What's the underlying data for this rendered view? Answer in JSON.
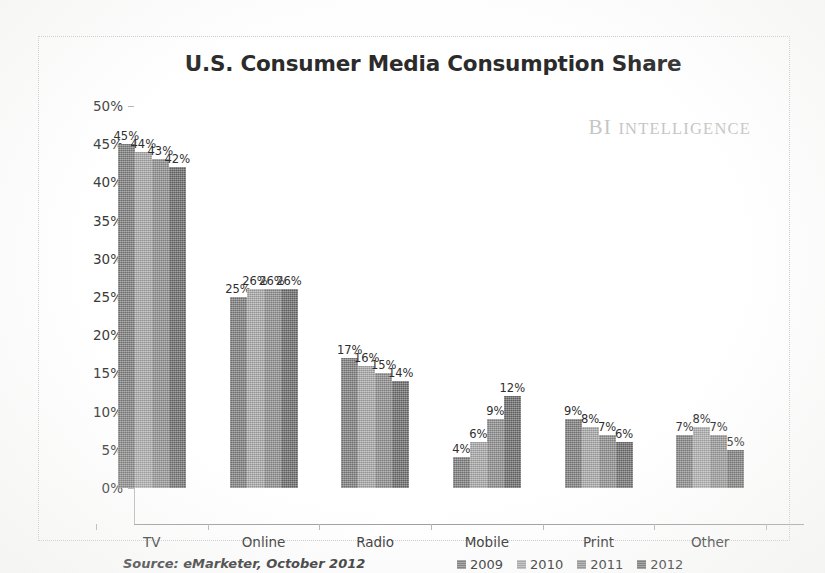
{
  "watermark": {
    "prefix": "BI",
    "word": "INTELLIGENCE"
  },
  "source_note": "Source: eMarketer, October 2012",
  "colors": {
    "series_2009": "#7e7e7e",
    "series_2010": "#aaaaaa",
    "series_2011": "#8f8f8f",
    "series_2012": "#6b6b6b",
    "axis": "#9d9d9b",
    "frame_border": "#c9c9c7",
    "title_text": "#2b2b2b",
    "watermark_text": "#c6c6c4"
  },
  "chart_data": {
    "type": "bar",
    "title": "U.S. Consumer Media Consumption Share",
    "xlabel": "",
    "ylabel": "",
    "ylim": [
      0,
      50
    ],
    "ytick_labels": [
      "50%",
      "45%",
      "40%",
      "35%",
      "30%",
      "25%",
      "20%",
      "15%",
      "10%",
      "5%",
      "0%"
    ],
    "ytick_values": [
      50,
      45,
      40,
      35,
      30,
      25,
      20,
      15,
      10,
      5,
      0
    ],
    "grid": false,
    "legend_position": "bottom",
    "categories": [
      "TV",
      "Online",
      "Radio",
      "Mobile",
      "Print",
      "Other"
    ],
    "series": [
      {
        "name": "2009",
        "values": [
          45,
          25,
          17,
          4,
          9,
          7
        ],
        "labels": [
          "45%",
          "25%",
          "17%",
          "4%",
          "9%",
          "7%"
        ]
      },
      {
        "name": "2010",
        "values": [
          44,
          26,
          16,
          6,
          8,
          8
        ],
        "labels": [
          "44%",
          "26%",
          "16%",
          "6%",
          "8%",
          "8%"
        ]
      },
      {
        "name": "2011",
        "values": [
          43,
          26,
          15,
          9,
          7,
          7
        ],
        "labels": [
          "43%",
          "26%",
          "15%",
          "9%",
          "7%",
          "7%"
        ]
      },
      {
        "name": "2012",
        "values": [
          42,
          26,
          14,
          12,
          6,
          5
        ],
        "labels": [
          "42%",
          "26%",
          "14%",
          "12%",
          "6%",
          "5%"
        ]
      }
    ]
  }
}
